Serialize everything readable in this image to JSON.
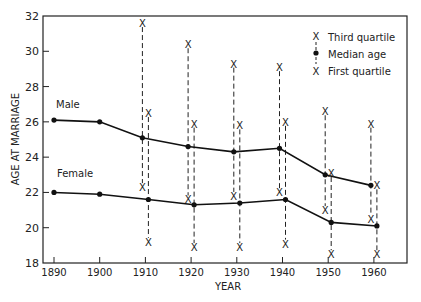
{
  "chart_data": {
    "type": "line",
    "title": "",
    "xlabel": "YEAR",
    "ylabel": "AGE AT MARRIAGE",
    "ylim": [
      18,
      32
    ],
    "xlim": [
      1887,
      1967
    ],
    "grid": false,
    "x_ticks": [
      1890,
      1900,
      1910,
      1920,
      1930,
      1940,
      1950,
      1960
    ],
    "y_ticks": [
      18,
      20,
      22,
      24,
      26,
      28,
      30,
      32
    ],
    "legend": {
      "position": "upper right",
      "entries": [
        {
          "symbol": "X",
          "label": "Third quartile"
        },
        {
          "symbol": "dot",
          "label": "Median age"
        },
        {
          "symbol": "X",
          "label": "First quartile"
        }
      ]
    },
    "series": [
      {
        "name": "Male",
        "label_text": "Male",
        "x": [
          1890,
          1900,
          1910,
          1920,
          1930,
          1940,
          1950,
          1960
        ],
        "median": [
          26.1,
          26.0,
          25.1,
          24.6,
          24.3,
          24.5,
          23.0,
          22.4
        ],
        "third_quartile": [
          null,
          null,
          31.6,
          30.4,
          29.3,
          29.1,
          26.6,
          25.9
        ],
        "first_quartile": [
          null,
          null,
          22.3,
          21.6,
          21.8,
          22.0,
          21.0,
          20.5
        ]
      },
      {
        "name": "Female",
        "label_text": "Female",
        "x": [
          1890,
          1900,
          1910,
          1920,
          1930,
          1940,
          1950,
          1960
        ],
        "median": [
          22.0,
          21.9,
          21.6,
          21.3,
          21.4,
          21.6,
          20.3,
          20.1
        ],
        "third_quartile": [
          null,
          null,
          26.5,
          25.9,
          25.8,
          26.0,
          23.1,
          22.4
        ],
        "first_quartile": [
          null,
          null,
          19.2,
          18.9,
          18.9,
          19.1,
          18.5,
          18.5
        ]
      }
    ]
  },
  "labels": {
    "male": "Male",
    "female": "Female",
    "xlabel": "YEAR",
    "ylabel": "AGE AT MARRIAGE",
    "legend_q3": "Third quartile",
    "legend_median": "Median age",
    "legend_q1": "First quartile"
  }
}
